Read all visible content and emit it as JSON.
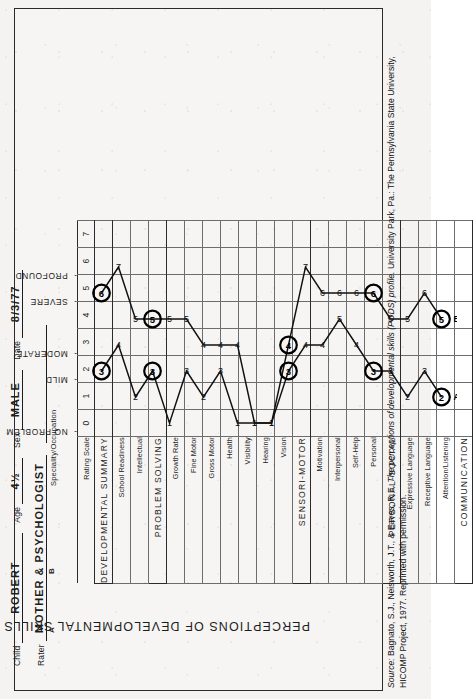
{
  "form": {
    "child_label": "Child",
    "child_value": "ROBERT",
    "age_label": "Age",
    "age_value": "4½",
    "sex_label": "Sex",
    "sex_value": "MALE",
    "date_label": "Date",
    "date_value": "8/3/77",
    "rater_label": "Rater",
    "rater_value": "MOTHER & PSYCHOLOGIST",
    "specialty_label": "Speciality/Occupation",
    "specialty_value": "",
    "marker_a": "A",
    "marker_b": "B"
  },
  "title": "PERCEPTIONS OF DEVELOPMENTAL SKILLS (PODS)",
  "scale": {
    "header_label": "Rating Scale",
    "numbers": [
      "0",
      "1",
      "2",
      "3",
      "4",
      "5",
      "6",
      "7"
    ],
    "captions": [
      {
        "tick": "-",
        "text": "NO PROBLEM",
        "at": 1
      },
      {
        "tick": "-",
        "text": "MILD",
        "at": 3
      },
      {
        "tick": "-",
        "text": "MODERATE",
        "at": 4
      },
      {
        "tick": "-",
        "text": "SEVERE",
        "at": 6
      },
      {
        "tick": "-",
        "text": "PROFOUND",
        "at": 7
      }
    ]
  },
  "rows": [
    {
      "label": "DEVELOPMENTAL SUMMARY",
      "major": true,
      "a": 3,
      "b": 6
    },
    {
      "label": "School Readiness",
      "major": false,
      "a": 4,
      "b": 7
    },
    {
      "label": "Intellectual",
      "major": false,
      "a": 2,
      "b": 5
    },
    {
      "label": "PROBLEM SOLVING",
      "major": true,
      "a": 3,
      "b": 5
    },
    {
      "label": "Growth Rate",
      "major": false,
      "a": 1,
      "b": 5
    },
    {
      "label": "Fine Motor",
      "major": false,
      "a": 3,
      "b": 5
    },
    {
      "label": "Gross Motor",
      "major": false,
      "a": 2,
      "b": 4
    },
    {
      "label": "Health",
      "major": false,
      "a": 3,
      "b": 4
    },
    {
      "label": "Visibility",
      "major": false,
      "a": 1,
      "b": 4
    },
    {
      "label": "Hearing",
      "major": false,
      "a": 1,
      "b": 1
    },
    {
      "label": "Vision",
      "major": false,
      "a": 1,
      "b": 1
    },
    {
      "label": "SENSORI-MOTOR",
      "major": true,
      "a": 3,
      "b": 4
    },
    {
      "label": "Motivation",
      "major": false,
      "a": 4,
      "b": 7
    },
    {
      "label": "Interpersonal",
      "major": false,
      "a": 4,
      "b": 6
    },
    {
      "label": "Self-Help",
      "major": false,
      "a": 5,
      "b": 6
    },
    {
      "label": "Personal",
      "major": false,
      "a": 4,
      "b": 6
    },
    {
      "label": "PERSONAL-SOCIAL",
      "major": true,
      "a": 3,
      "b": 6
    },
    {
      "label": "Expressive Language",
      "major": false,
      "a": 3,
      "b": 5
    },
    {
      "label": "Receptive Language",
      "major": false,
      "a": 2,
      "b": 5
    },
    {
      "label": "Attention/Listening",
      "major": false,
      "a": 3,
      "b": 6
    },
    {
      "label": "COMMUNICATION",
      "major": true,
      "a": 2,
      "b": 5
    }
  ],
  "chart_data": {
    "type": "line",
    "title": "PERCEPTIONS OF DEVELOPMENTAL SKILLS (PODS)",
    "xlabel": "Rating Scale",
    "ylabel": "",
    "xlim": [
      0,
      7
    ],
    "grid": true,
    "orientation": "horizontal-profile",
    "categories": [
      "DEVELOPMENTAL SUMMARY",
      "School Readiness",
      "Intellectual",
      "PROBLEM SOLVING",
      "Growth Rate",
      "Fine Motor",
      "Gross Motor",
      "Health",
      "Visibility",
      "Hearing",
      "Vision",
      "SENSORI-MOTOR",
      "Motivation",
      "Interpersonal",
      "Self-Help",
      "Personal",
      "PERSONAL-SOCIAL",
      "Expressive Language",
      "Receptive Language",
      "Attention/Listening",
      "COMMUNICATION"
    ],
    "series": [
      {
        "name": "A (Mother)",
        "values": [
          3,
          4,
          2,
          3,
          1,
          3,
          2,
          3,
          1,
          1,
          1,
          3,
          4,
          4,
          5,
          4,
          3,
          3,
          2,
          3,
          2
        ]
      },
      {
        "name": "B (Psychologist)",
        "values": [
          6,
          7,
          5,
          5,
          5,
          5,
          4,
          4,
          4,
          1,
          1,
          4,
          7,
          6,
          6,
          6,
          6,
          5,
          5,
          6,
          5
        ]
      }
    ],
    "tick_labels": [
      "0",
      "1",
      "2",
      "3",
      "4",
      "5",
      "6",
      "7"
    ],
    "scale_anchors": {
      "1": "NO PROBLEM",
      "3": "MILD",
      "4": "MODERATE",
      "6": "SEVERE",
      "7": "PROFOUND"
    },
    "legend": "Circled values mark summary-level scores for raters A and B"
  },
  "source": {
    "lead": "Source:",
    "text_part1": " Bagnato, S.J., Neisworth, J.T., & Eaves, R.E. ",
    "italic": "The perceptions of developmental skills (PODS) profile.",
    "text_part2": " University Park, Pa.: The Pennsylvania State University, HICOMP Project, 1977. Reprinted with permission."
  }
}
